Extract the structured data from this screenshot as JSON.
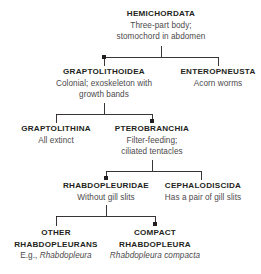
{
  "diagram": {
    "type": "cladogram",
    "line_color": "#231f20",
    "title_color": "#231f20",
    "desc_color": "#4c4a4b",
    "background": "#ffffff",
    "nodes": [
      {
        "id": "hemichordata",
        "title": "HEMICHORDATA",
        "desc_line1": "Three-part body;",
        "desc_line2": "stomochord in abdomen",
        "level": 0
      },
      {
        "id": "graptolithoidea",
        "title": "GRAPTOLITHOIDEA",
        "desc_line1": "Colonial; exoskeleton with",
        "desc_line2": "growth bands",
        "level": 1
      },
      {
        "id": "enteropneusta",
        "title": "ENTEROPNEUSTA",
        "desc_line1": "Acorn worms",
        "desc_line2": "",
        "level": 1
      },
      {
        "id": "graptolithina",
        "title": "GRAPTOLITHINA",
        "desc_line1": "All extinct",
        "desc_line2": "",
        "level": 2
      },
      {
        "id": "pterobranchia",
        "title": "PTEROBRANCHIA",
        "desc_line1": "Filter-feeding;",
        "desc_line2": "ciliated tentacles",
        "level": 2
      },
      {
        "id": "rhabdopleuridae",
        "title": "RHABDOPLEURIDAE",
        "desc_line1": "Without gill slits",
        "desc_line2": "",
        "level": 3
      },
      {
        "id": "cephalodiscida",
        "title": "CEPHALODISCIDA",
        "desc_line1": "Has a pair of gill slits",
        "desc_line2": "",
        "level": 3
      },
      {
        "id": "other-rhabdopleurans",
        "title_line1": "OTHER",
        "title_line2": "RHABDOPLEURANS",
        "desc_prefix": "E.g., ",
        "desc_species": "Rhabdopleura",
        "level": 4
      },
      {
        "id": "compact-rhabdopleura",
        "title_line1": "COMPACT",
        "title_line2": "RHABDOPLEURA",
        "desc_species": "Rhabdopleura compacta",
        "level": 4
      }
    ]
  }
}
